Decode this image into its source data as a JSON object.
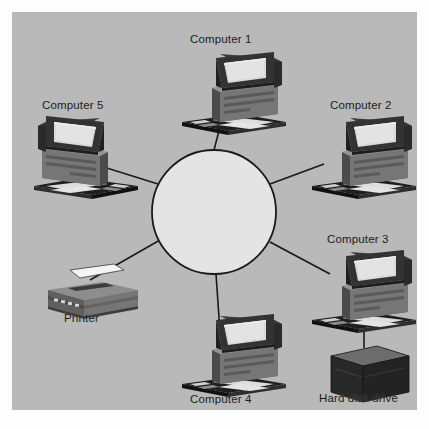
{
  "diagram": {
    "type": "network-topology",
    "topology": "star",
    "title": "",
    "background_color": "#b9b9b9",
    "page_color": "#fdfdfd",
    "line_color": "#1a1a1a",
    "hub": {
      "name": "central-hub",
      "shape": "circle",
      "fill_color": "#e4e4e4",
      "stroke_color": "#1a1a1a",
      "cx": 202,
      "cy": 200,
      "r": 62,
      "label": ""
    },
    "nodes": [
      {
        "id": "computer-1",
        "label": "Computer 1",
        "device": "computer",
        "orientation": "right-facing",
        "x": 186,
        "y": 68,
        "label_x": 178,
        "label_y": 22
      },
      {
        "id": "computer-2",
        "label": "Computer 2",
        "device": "computer",
        "orientation": "right-facing",
        "x": 322,
        "y": 134,
        "label_x": 318,
        "label_y": 88
      },
      {
        "id": "computer-3",
        "label": "Computer 3",
        "device": "computer",
        "orientation": "right-facing",
        "x": 320,
        "y": 268,
        "label_x": 315,
        "label_y": 222
      },
      {
        "id": "computer-4",
        "label": "Computer 4",
        "device": "computer",
        "orientation": "right-facing",
        "x": 186,
        "y": 330,
        "label_x": 178,
        "label_y": 382
      },
      {
        "id": "computer-5",
        "label": "Computer 5",
        "device": "computer",
        "orientation": "left-facing",
        "x": 48,
        "y": 112,
        "label_x": 30,
        "label_y": 88
      },
      {
        "id": "printer",
        "label": "Printer",
        "device": "printer",
        "orientation": "left-facing",
        "x": 42,
        "y": 268,
        "label_x": 52,
        "label_y": 301
      },
      {
        "id": "hard-disk-drive",
        "label": "Hard disk drive",
        "device": "hard-disk-drive",
        "orientation": "front",
        "x": 308,
        "y": 330,
        "label_x": 307,
        "label_y": 381
      }
    ],
    "connections": [
      {
        "from": "central-hub",
        "to": "computer-1",
        "style": "straight-line"
      },
      {
        "from": "central-hub",
        "to": "computer-2",
        "style": "straight-line"
      },
      {
        "from": "central-hub",
        "to": "computer-3",
        "style": "straight-line"
      },
      {
        "from": "central-hub",
        "to": "computer-4",
        "style": "straight-line"
      },
      {
        "from": "central-hub",
        "to": "computer-5",
        "style": "straight-line"
      },
      {
        "from": "central-hub",
        "to": "printer",
        "style": "straight-line"
      },
      {
        "from": "computer-3",
        "to": "hard-disk-drive",
        "style": "straight-line"
      }
    ],
    "palette": {
      "monitor_bezel_dark": "#2b2b2b",
      "monitor_bezel_mid": "#4a4a4a",
      "screen_light": "#dcdcdc",
      "case_mid": "#6e6e6e",
      "case_dark": "#4a4a4a",
      "case_light": "#8c8c8c",
      "keyboard_dark": "#242424",
      "keyboard_keys": "#d8d8d8",
      "printer_body": "#6b6b6b",
      "printer_top": "#8a8a8a",
      "paper_white": "#f2f2f2",
      "hdd_front": "#2a2a2a",
      "hdd_top": "#6a6a6a"
    }
  }
}
